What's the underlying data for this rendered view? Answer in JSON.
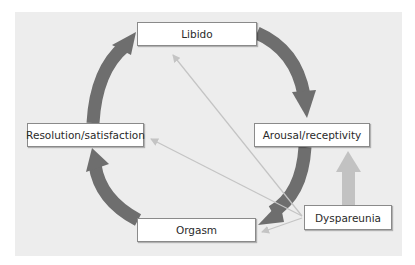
{
  "diagram": {
    "type": "cycle",
    "nodes": {
      "libido": "Libido",
      "arousal": "Arousal/receptivity",
      "orgasm": "Orgasm",
      "resolution": "Resolution/satisfaction",
      "dyspareunia": "Dyspareunia"
    },
    "cycle_order": [
      "Libido",
      "Arousal/receptivity",
      "Orgasm",
      "Resolution/satisfaction"
    ],
    "influences": [
      {
        "from": "Dyspareunia",
        "to": "Arousal/receptivity",
        "style": "thick-light"
      },
      {
        "from": "Dyspareunia",
        "to": "Libido",
        "style": "thin-light"
      },
      {
        "from": "Dyspareunia",
        "to": "Resolution/satisfaction",
        "style": "thin-light"
      },
      {
        "from": "Dyspareunia",
        "to": "Orgasm",
        "style": "thin-light"
      }
    ],
    "colors": {
      "panel": "#ededed",
      "cycle_arrow": "#6e6e6e",
      "influence_thick": "#c2c2c2",
      "influence_thin": "#c4c4c4"
    }
  }
}
